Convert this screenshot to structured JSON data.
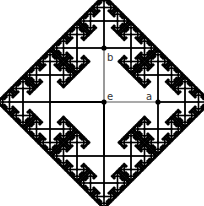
{
  "diagram": {
    "background": "#ffffff",
    "edge_color": "#000000",
    "highlight_edge_color": "#555555",
    "center": [
      104,
      102
    ],
    "first_edge_length": 54,
    "scale_ratio": 0.5,
    "depth": 7,
    "nodes": {
      "e": {
        "label": "e",
        "pos": [
          104,
          102
        ],
        "label_pos": [
          107,
          92
        ]
      },
      "a": {
        "label": "a",
        "pos": [
          158,
          102
        ],
        "label_pos": [
          146,
          92
        ]
      },
      "b": {
        "label": "b",
        "pos": [
          104,
          48
        ],
        "label_pos": [
          107,
          53
        ]
      }
    }
  }
}
